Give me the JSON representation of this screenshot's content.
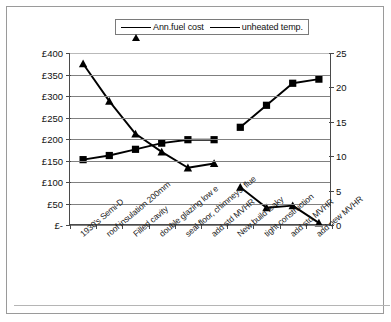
{
  "legend": {
    "position": "top-center",
    "items": [
      {
        "label": "Ann.fuel cost",
        "marker": "triangle-marker",
        "color": "#000000"
      },
      {
        "label": "unheated temp.",
        "marker": "square-marker",
        "color": "#000000"
      }
    ]
  },
  "axes": {
    "left": {
      "ticks": [
        "£400",
        "£350",
        "£300",
        "£250",
        "£200",
        "£150",
        "£100",
        "£50",
        "£-"
      ],
      "min": 0,
      "max": 400,
      "step": 50
    },
    "right": {
      "ticks": [
        "25",
        "20",
        "15",
        "10",
        "5",
        "0"
      ],
      "min": 0,
      "max": 25,
      "step": 5
    }
  },
  "chart_data": {
    "type": "line",
    "title": "",
    "subtitle": "",
    "xlabel": "",
    "ylabel": "",
    "grid": true,
    "legend_position": "top-center",
    "categories": [
      "1930's Semi-D",
      "roof insulation 200mm",
      "Filled cavity",
      "double glazing low e",
      "seal floor, chimneys, flue",
      "add std MVHR",
      "New build leaky",
      "tight construction",
      "add std MVHR",
      "add new MVHR"
    ],
    "series": [
      {
        "name": "Ann.fuel cost",
        "axis": "left",
        "unit": "£",
        "marker": "triangle",
        "ylim": [
          0,
          400
        ],
        "values": [
          375,
          288,
          212,
          170,
          133,
          143,
          88,
          40,
          45,
          5
        ]
      },
      {
        "name": "unheated temp.",
        "axis": "right",
        "unit": "°C",
        "marker": "square",
        "ylim": [
          0,
          25
        ],
        "values": [
          9.5,
          10.1,
          11.0,
          11.9,
          12.4,
          12.4,
          14.2,
          17.4,
          20.6,
          21.2
        ]
      }
    ]
  }
}
